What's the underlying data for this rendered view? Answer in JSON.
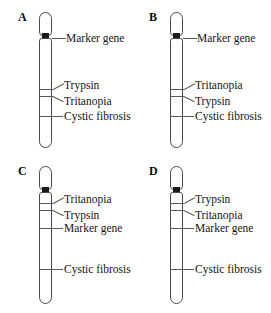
{
  "figure": {
    "type": "diagram",
    "panel_count": 4,
    "genes": [
      "Marker gene",
      "Trypsin",
      "Tritanopia",
      "Cystic fibrosis"
    ]
  },
  "panels": [
    {
      "id": "A",
      "label": "A",
      "centromere_marker": "centromere-marker",
      "loci": [
        {
          "name": "Marker gene",
          "position": "centromere",
          "leader": "straight"
        },
        {
          "name": "Trypsin",
          "position": "upper-band",
          "leader": "angled-up"
        },
        {
          "name": "Tritanopia",
          "position": "lower-band",
          "leader": "angled-down"
        },
        {
          "name": "Cystic fibrosis",
          "position": "mid-arm",
          "leader": "straight"
        }
      ]
    },
    {
      "id": "B",
      "label": "B",
      "centromere_marker": "centromere-marker",
      "loci": [
        {
          "name": "Marker gene",
          "position": "centromere",
          "leader": "straight"
        },
        {
          "name": "Tritanopia",
          "position": "upper-band",
          "leader": "angled-up"
        },
        {
          "name": "Trypsin",
          "position": "lower-band",
          "leader": "angled-down"
        },
        {
          "name": "Cystic fibrosis",
          "position": "mid-arm",
          "leader": "straight"
        }
      ]
    },
    {
      "id": "C",
      "label": "C",
      "centromere_marker": "centromere-marker",
      "loci": [
        {
          "name": "Tritanopia",
          "position": "upper-band",
          "leader": "angled-up"
        },
        {
          "name": "Trypsin",
          "position": "lower-band",
          "leader": "angled-down"
        },
        {
          "name": "Marker gene",
          "position": "below-bands",
          "leader": "straight"
        },
        {
          "name": "Cystic fibrosis",
          "position": "mid-arm",
          "leader": "straight"
        }
      ]
    },
    {
      "id": "D",
      "label": "D",
      "centromere_marker": "centromere-marker",
      "loci": [
        {
          "name": "Trypsin",
          "position": "upper-band",
          "leader": "angled-up"
        },
        {
          "name": "Tritanopia",
          "position": "lower-band",
          "leader": "angled-down"
        },
        {
          "name": "Marker gene",
          "position": "below-bands",
          "leader": "straight"
        },
        {
          "name": "Cystic fibrosis",
          "position": "mid-arm",
          "leader": "straight"
        }
      ]
    }
  ],
  "colors": {
    "background": "#ffffff",
    "outline": "#4a4a4a",
    "centromere": "#1a1a1a",
    "text": "#151515"
  }
}
